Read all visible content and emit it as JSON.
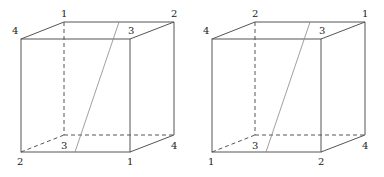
{
  "diagram": {
    "type": "two cubes with a diagonal cutting plane line and labeled vertices",
    "colors": {
      "edge": "#555555",
      "diagonal": "#888888",
      "label": "#222222"
    },
    "cubes": [
      {
        "id": "left",
        "offset_x": 0,
        "labels": {
          "top_front_left": "4",
          "top_back_left": "1",
          "top_back_right": "2",
          "top_front_right": "3",
          "bottom_front_left": "2",
          "bottom_back_left": "3",
          "bottom_front_right": "1",
          "bottom_back_right": "4"
        }
      },
      {
        "id": "right",
        "offset_x": 191,
        "labels": {
          "top_front_left": "4",
          "top_back_left": "2",
          "top_back_right": "1",
          "top_front_right": "3",
          "bottom_front_left": "1",
          "bottom_back_left": "3",
          "bottom_front_right": "2",
          "bottom_back_right": "4"
        }
      }
    ]
  }
}
